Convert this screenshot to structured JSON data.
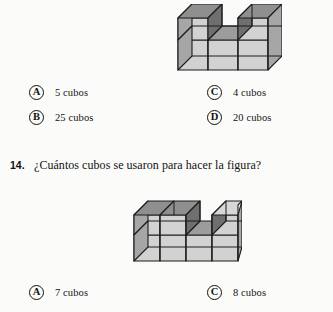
{
  "document": {
    "type": "math-worksheet-scan",
    "language": "es",
    "background_color": "#fbfbfa",
    "ink_color": "#141414"
  },
  "figure_colors": {
    "top_face": "#8f8f8f",
    "front_face": "#d2d2d2",
    "side_face": "#a6a6a6",
    "inner_face": "#9c9c9c",
    "outline": "#1c1c1c"
  },
  "top_question": {
    "figure": {
      "name": "isometric-cube-figure-top",
      "description": "Arrangement of unit cubes, 2 layers, U-shaped notch in the top layer",
      "cube_count": 5
    },
    "options": [
      {
        "letter": "A",
        "label": "5 cubos"
      },
      {
        "letter": "B",
        "label": "25 cubos"
      },
      {
        "letter": "C",
        "label": "4 cubos"
      },
      {
        "letter": "D",
        "label": "20 cubos"
      }
    ]
  },
  "question_14": {
    "number": "14.",
    "text": "¿Cuántos cubos se usaron para hacer la figura?",
    "figure": {
      "name": "isometric-cube-figure-bottom",
      "description": "Arrangement of unit cubes, 2 layers, notch between left pair and right block",
      "cube_count": 7
    },
    "options": [
      {
        "letter": "A",
        "label": "7 cubos"
      },
      {
        "letter": "C",
        "label": "8 cubos"
      }
    ]
  }
}
